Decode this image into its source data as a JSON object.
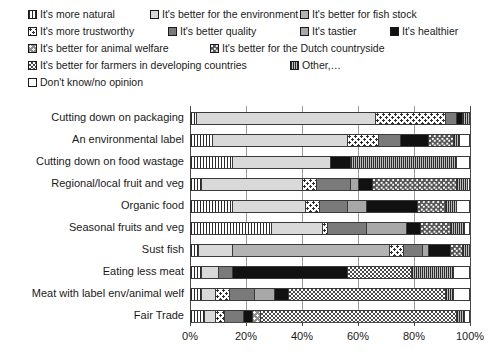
{
  "legend": {
    "rows": [
      [
        {
          "key": "natural",
          "label": "It's more natural",
          "pattern": "p-vstripe"
        },
        {
          "key": "environment",
          "label": "It's better for the environment",
          "pattern": "p-lightgray"
        },
        {
          "key": "fish_stock",
          "label": "It's better for fish stock",
          "pattern": "p-medgray"
        }
      ],
      [
        {
          "key": "trustworthy",
          "label": "It's more trustworthy",
          "pattern": "p-dots"
        },
        {
          "key": "quality",
          "label": "It's better quality",
          "pattern": "p-darkgray"
        },
        {
          "key": "tastier",
          "label": "It's tastier",
          "pattern": "p-tastier"
        },
        {
          "key": "healthier",
          "label": "It's healthier",
          "pattern": "p-black"
        }
      ],
      [
        {
          "key": "animal_welfare",
          "label": "It's better for animal welfare",
          "pattern": "p-welfare"
        },
        {
          "key": "dutch_countryside",
          "label": "It's better for the Dutch countryside",
          "pattern": "p-dutch"
        }
      ],
      [
        {
          "key": "farmers",
          "label": "It's better for farmers in developing countries",
          "pattern": "p-farmers"
        },
        {
          "key": "other",
          "label": "Other,…",
          "pattern": "p-other"
        }
      ],
      [
        {
          "key": "dont_know",
          "label": "Don't know/no opinion",
          "pattern": "p-none"
        }
      ]
    ]
  },
  "chart_data": {
    "type": "bar",
    "orientation": "horizontal",
    "stacked": true,
    "normalized_percent": true,
    "title": "",
    "xlabel": "",
    "ylabel": "",
    "xlim": [
      0,
      100
    ],
    "xticks": [
      0,
      20,
      40,
      60,
      80,
      100
    ],
    "xticklabels": [
      "0%",
      "20%",
      "40%",
      "60%",
      "80%",
      "100%"
    ],
    "grid": true,
    "legend_position": "top",
    "categories": [
      "Cutting down on packaging",
      "An environmental label",
      "Cutting down on food wastage",
      "Regional/local fruit and veg",
      "Organic food",
      "Seasonal fruits and veg",
      "Sust fish",
      "Eating less meat",
      "Meat with label env/animal welf",
      "Fair Trade"
    ],
    "series": [
      {
        "name": "It's more natural",
        "key": "natural",
        "pattern": "p-vstripe",
        "values": [
          2,
          8,
          15,
          4,
          15,
          29,
          3,
          4,
          4,
          5
        ]
      },
      {
        "name": "It's better for the environment",
        "key": "environment",
        "pattern": "p-lightgray",
        "values": [
          64,
          48,
          35,
          36,
          26,
          18,
          12,
          6,
          5,
          4
        ]
      },
      {
        "name": "It's better for fish stock",
        "key": "fish_stock",
        "pattern": "p-medgray",
        "values": [
          0,
          0,
          0,
          0,
          0,
          0,
          56,
          0,
          0,
          0
        ]
      },
      {
        "name": "It's more trustworthy",
        "key": "trustworthy",
        "pattern": "p-dots",
        "values": [
          25,
          11,
          0,
          5,
          5,
          2,
          5,
          0,
          5,
          3
        ]
      },
      {
        "name": "It's better quality",
        "key": "quality",
        "pattern": "p-darkgray",
        "values": [
          4,
          8,
          0,
          12,
          10,
          14,
          7,
          5,
          9,
          7
        ]
      },
      {
        "name": "It's tastier",
        "key": "tastier",
        "pattern": "p-tastier",
        "values": [
          0,
          0,
          0,
          3,
          7,
          14,
          2,
          0,
          7,
          0
        ]
      },
      {
        "name": "It's healthier",
        "key": "healthier",
        "pattern": "p-black",
        "values": [
          2,
          10,
          7,
          5,
          18,
          5,
          8,
          41,
          5,
          3
        ]
      },
      {
        "name": "It's better for animal welfare",
        "key": "animal_welfare",
        "pattern": "p-welfare",
        "values": [
          0,
          0,
          0,
          0,
          0,
          0,
          0,
          0,
          0,
          3
        ]
      },
      {
        "name": "It's better for the Dutch countryside",
        "key": "dutch_countryside",
        "pattern": "p-dutch",
        "values": [
          0,
          9,
          0,
          30,
          10,
          11,
          4,
          0,
          0,
          0
        ]
      },
      {
        "name": "It's better for farmers in developing countries",
        "key": "farmers",
        "pattern": "p-farmers",
        "values": [
          0,
          0,
          0,
          0,
          0,
          0,
          0,
          23,
          56,
          70
        ]
      },
      {
        "name": "Other,…",
        "key": "other",
        "pattern": "p-other",
        "values": [
          3,
          2,
          38,
          4,
          4,
          5,
          3,
          15,
          3,
          3
        ]
      },
      {
        "name": "Don't know/no opinion",
        "key": "dont_know",
        "pattern": "p-none",
        "values": [
          0,
          4,
          5,
          1,
          5,
          2,
          0,
          6,
          6,
          2
        ]
      }
    ]
  }
}
